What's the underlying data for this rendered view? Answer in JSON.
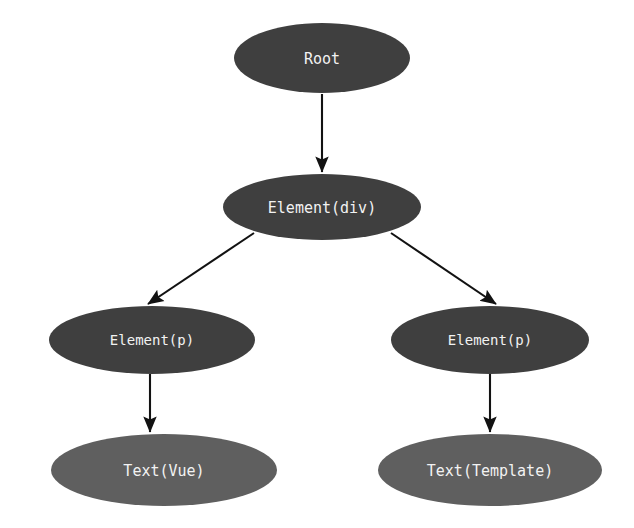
{
  "diagram": {
    "background_color": "#ffffff",
    "node_fill_dark": "#3f3f3f",
    "node_fill_light": "#5f5f5f",
    "node_text_color": "#f2f2f2",
    "edge_color": "#121212",
    "nodes": [
      {
        "id": "root",
        "label": "Root",
        "level": 0,
        "cx": 322,
        "cy": 58,
        "rx": 88,
        "ry": 35,
        "fill": "#3f3f3f",
        "font_size": 15
      },
      {
        "id": "element-div",
        "label": "Element(div)",
        "level": 1,
        "cx": 322,
        "cy": 207,
        "rx": 99,
        "ry": 33,
        "fill": "#3f3f3f",
        "font_size": 15
      },
      {
        "id": "element-p-left",
        "label": "Element(p)",
        "level": 2,
        "cx": 152,
        "cy": 340,
        "rx": 103,
        "ry": 34,
        "fill": "#3f3f3f",
        "font_size": 14
      },
      {
        "id": "element-p-right",
        "label": "Element(p)",
        "level": 2,
        "cx": 490,
        "cy": 340,
        "rx": 99,
        "ry": 34,
        "fill": "#3f3f3f",
        "font_size": 14
      },
      {
        "id": "text-vue",
        "label": "Text(Vue)",
        "level": 3,
        "cx": 164,
        "cy": 470,
        "rx": 113,
        "ry": 36,
        "fill": "#5f5f5f",
        "font_size": 15
      },
      {
        "id": "text-template",
        "label": "Text(Template)",
        "level": 3,
        "cx": 490,
        "cy": 470,
        "rx": 112,
        "ry": 36,
        "fill": "#5f5f5f",
        "font_size": 15
      }
    ],
    "edges": [
      {
        "id": "edge-root-to-div",
        "from": "root",
        "to": "element-div",
        "x1": 322,
        "y1": 94,
        "x2": 322,
        "y2": 172,
        "arrowhead": "filled-triangle"
      },
      {
        "id": "edge-div-to-p-left",
        "from": "element-div",
        "to": "element-p-left",
        "x1": 254,
        "y1": 233,
        "x2": 148,
        "y2": 304,
        "arrowhead": "filled-triangle"
      },
      {
        "id": "edge-div-to-p-right",
        "from": "element-div",
        "to": "element-p-right",
        "x1": 391,
        "y1": 233,
        "x2": 496,
        "y2": 304,
        "arrowhead": "filled-triangle"
      },
      {
        "id": "edge-p-left-to-text-vue",
        "from": "element-p-left",
        "to": "text-vue",
        "x1": 150,
        "y1": 374,
        "x2": 150,
        "y2": 432,
        "arrowhead": "filled-triangle"
      },
      {
        "id": "edge-p-right-to-text-template",
        "from": "element-p-right",
        "to": "text-template",
        "x1": 490,
        "y1": 374,
        "x2": 490,
        "y2": 432,
        "arrowhead": "filled-triangle"
      }
    ]
  }
}
